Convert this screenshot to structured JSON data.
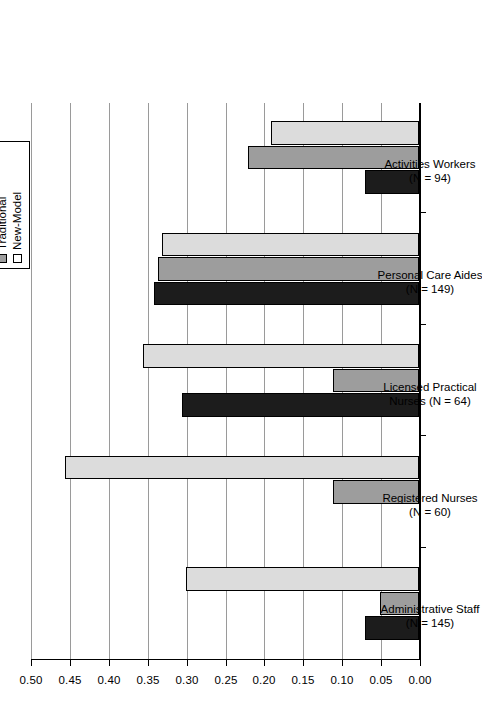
{
  "chart_data": {
    "type": "bar",
    "orientation": "horizontal",
    "title": "",
    "subtitle": "",
    "xlabel": "",
    "ylabel": "",
    "value_axis_ticks": [
      "0.50",
      "0.45",
      "0.40",
      "0.35",
      "0.30",
      "0.25",
      "0.20",
      "0.15",
      "0.10",
      "0.05",
      "0.00"
    ],
    "value_axis_tick_values": [
      0.5,
      0.45,
      0.4,
      0.35,
      0.3,
      0.25,
      0.2,
      0.15,
      0.1,
      0.05,
      0.0
    ],
    "ylim": [
      0.0,
      0.5
    ],
    "axis_direction": "reversed",
    "grid": "value-axis gridlines only",
    "legend_position": "top-right (rotated)",
    "categories": [
      "Administrative Staff\n(N = 145)",
      "Registered Nurses\n(N = 60)",
      "Licensed Practical\nNurses (N = 64)",
      "Personal Care Aides\n(N = 149)",
      "Activities Workers\n(N = 94)"
    ],
    "category_labels": [
      {
        "line1": "Administrative Staff",
        "line2": "(N = 145)"
      },
      {
        "line1": "Registered Nurses",
        "line2": "(N = 60)"
      },
      {
        "line1": "Licensed Practical",
        "line2": "Nurses (N = 64)"
      },
      {
        "line1": "Personal Care Aides",
        "line2": "(N = 149)"
      },
      {
        "line1": "Activities Workers",
        "line2": "(N = 94)"
      }
    ],
    "series": [
      {
        "name": "Fewer than 16 beds",
        "color": "#1c1c1c",
        "values": [
          0.07,
          0.0,
          0.305,
          0.34,
          0.07
        ]
      },
      {
        "name": "Traditional",
        "color": "#9d9d9d",
        "values": [
          0.05,
          0.11,
          0.11,
          0.335,
          0.22
        ]
      },
      {
        "name": "New-Model",
        "color": "#ffffff",
        "values": [
          0.3,
          0.455,
          0.355,
          0.33,
          0.19
        ]
      }
    ]
  },
  "legend": {
    "items": [
      {
        "label": "Fewer than 16 beds",
        "swatch": "black-square-icon"
      },
      {
        "label": "Traditional",
        "swatch": "gray-square-icon"
      },
      {
        "label": "New-Model",
        "swatch": "white-square-icon"
      }
    ]
  }
}
